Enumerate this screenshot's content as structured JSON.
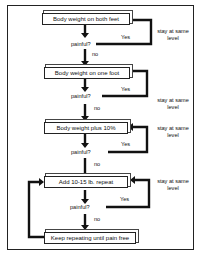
{
  "diagram": {
    "type": "flowchart",
    "steps": [
      {
        "label": "Body weight on both feet",
        "question": "painful?",
        "yes": "Yes",
        "no": "no",
        "side_note": [
          "stay at same",
          "level"
        ]
      },
      {
        "label": "Body weight on one foot",
        "question": "painful?",
        "yes": "Yes",
        "no": "no",
        "side_note": [
          "stay at same",
          "level"
        ]
      },
      {
        "label": "Body weight plus 10%",
        "question": "painful?",
        "yes": "Yes",
        "no": "no",
        "side_note": [
          "stay at same",
          "level"
        ]
      },
      {
        "label": "Add 10-15 lb. repeat",
        "question": "painful?",
        "yes": "Yes",
        "no": "no",
        "side_note": [
          "stay at same",
          "level"
        ]
      },
      {
        "label": "Keep repeating until pain free"
      }
    ],
    "colors": {
      "line": "#111111",
      "background": "#ffffff"
    }
  }
}
